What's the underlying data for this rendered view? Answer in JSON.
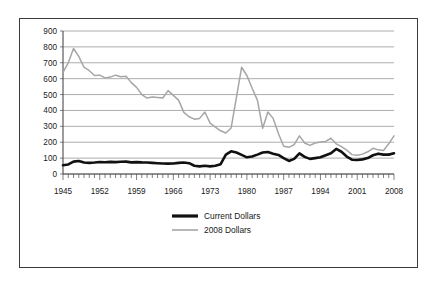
{
  "figure": {
    "border_color": "#3b3b3b",
    "background": "#ffffff"
  },
  "chart_data": {
    "type": "line",
    "title": "",
    "subtitle": "",
    "xlabel": "",
    "ylabel": "",
    "xlim": [
      1945,
      2008
    ],
    "ylim": [
      0,
      900
    ],
    "grid": true,
    "legend_position": "bottom-center",
    "y_ticks": [
      0,
      100,
      200,
      300,
      400,
      500,
      600,
      700,
      800,
      900
    ],
    "y_tick_labels": [
      "0",
      "100",
      "200",
      "300",
      "400",
      "500",
      "600",
      "700",
      "800",
      "900"
    ],
    "x_ticks": [
      1945,
      1952,
      1959,
      1966,
      1973,
      1980,
      1987,
      1994,
      2001,
      2008
    ],
    "x_tick_labels": [
      "1945",
      "1952",
      "1959",
      "1966",
      "1973",
      "1980",
      "1987",
      "1994",
      "2001",
      "2008"
    ],
    "x_minor_tick_interval": 1,
    "x": [
      1945,
      1946,
      1947,
      1948,
      1949,
      1950,
      1951,
      1952,
      1953,
      1954,
      1955,
      1956,
      1957,
      1958,
      1959,
      1960,
      1961,
      1962,
      1963,
      1964,
      1965,
      1966,
      1967,
      1968,
      1969,
      1970,
      1971,
      1972,
      1973,
      1974,
      1975,
      1976,
      1977,
      1978,
      1979,
      1980,
      1981,
      1982,
      1983,
      1984,
      1985,
      1986,
      1987,
      1988,
      1989,
      1990,
      1991,
      1992,
      1993,
      1994,
      1995,
      1996,
      1997,
      1998,
      1999,
      2000,
      2001,
      2002,
      2003,
      2004,
      2005,
      2006,
      2007,
      2008
    ],
    "series": [
      {
        "name": "Current Dollars",
        "color": "#111111",
        "line_width": 2.6,
        "values": [
          55,
          60,
          78,
          82,
          72,
          70,
          72,
          75,
          74,
          76,
          75,
          77,
          78,
          73,
          75,
          73,
          72,
          70,
          68,
          66,
          65,
          66,
          70,
          72,
          68,
          52,
          48,
          52,
          48,
          52,
          62,
          122,
          143,
          135,
          120,
          105,
          110,
          122,
          135,
          138,
          128,
          120,
          100,
          82,
          95,
          130,
          108,
          95,
          100,
          105,
          118,
          130,
          158,
          140,
          110,
          90,
          88,
          92,
          100,
          118,
          128,
          122,
          122,
          130
        ]
      },
      {
        "name": "2008 Dollars",
        "color": "#a6a6a6",
        "line_width": 1.5,
        "values": [
          640,
          700,
          790,
          740,
          672,
          650,
          620,
          622,
          605,
          610,
          622,
          612,
          615,
          575,
          545,
          500,
          478,
          485,
          482,
          478,
          525,
          495,
          465,
          388,
          360,
          345,
          350,
          390,
          320,
          295,
          272,
          258,
          290,
          480,
          672,
          620,
          540,
          465,
          288,
          390,
          350,
          255,
          175,
          168,
          185,
          240,
          195,
          180,
          195,
          202,
          205,
          225,
          190,
          172,
          150,
          122,
          118,
          125,
          140,
          162,
          152,
          148,
          190,
          240
        ]
      }
    ],
    "legend": [
      {
        "label": "Current Dollars",
        "color": "#111111",
        "style": "thick-line"
      },
      {
        "label": "2008 Dollars",
        "color": "#a6a6a6",
        "style": "thin-line"
      }
    ]
  }
}
